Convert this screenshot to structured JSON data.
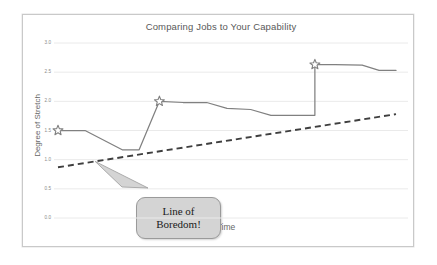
{
  "chart_data": {
    "type": "line",
    "title": "Comparing Jobs to Your Capability",
    "xlabel": "Time",
    "ylabel": "Degree of Stretch",
    "ylim": [
      0.0,
      3.0
    ],
    "xlim": [
      0,
      100
    ],
    "grid": true,
    "legend": "none",
    "y_ticks": [
      "3.0",
      "2.5",
      "2.0",
      "1.5",
      "1.0",
      "0.5",
      "0.0"
    ],
    "y_tick_values": [
      3.0,
      2.5,
      2.0,
      1.5,
      1.0,
      0.5,
      0.0
    ],
    "x_ticks": [],
    "series": [
      {
        "name": "Degree of Stretch",
        "style": "solid",
        "color": "#808080",
        "x": [
          0,
          8,
          19,
          24,
          24,
          30,
          37,
          44,
          50,
          57,
          63,
          70,
          76,
          76,
          82,
          90,
          95,
          100
        ],
        "values": [
          1.5,
          1.5,
          1.17,
          1.17,
          1.17,
          2.0,
          1.98,
          1.98,
          1.88,
          1.86,
          1.76,
          1.76,
          1.76,
          2.63,
          2.63,
          2.62,
          2.53,
          2.53
        ],
        "markers": [
          {
            "x": 0,
            "y": 1.5,
            "shape": "star"
          },
          {
            "x": 30,
            "y": 2.0,
            "shape": "star"
          },
          {
            "x": 76,
            "y": 2.63,
            "shape": "star"
          }
        ]
      },
      {
        "name": "Line of Boredom",
        "style": "dashed",
        "color": "#3f3f3f",
        "x": [
          0,
          100
        ],
        "values": [
          0.87,
          1.78
        ]
      }
    ],
    "annotations": [
      {
        "name": "line-of-boredom-callout",
        "lines": [
          "Line of",
          "Boredom!"
        ],
        "target_series": "Line of Boredom",
        "shape": "rounded-rect-callout",
        "fill": "#d4d4d4",
        "stroke": "#9a9a9a"
      }
    ]
  },
  "chart": {
    "title": "Comparing Jobs to Your Capability",
    "y_axis_label": "Degree of Stretch",
    "x_axis_label": "Time",
    "y_ticks": [
      "3.0",
      "2.5",
      "2.0",
      "1.5",
      "1.0",
      "0.5",
      "0.0"
    ],
    "callout": {
      "line1": "Line of",
      "line2": "Boredom!"
    }
  },
  "colors": {
    "series_line": "#808080",
    "boredom_line": "#3f3f3f",
    "gridline": "#eaeaea",
    "frame_border": "#c9c9c9",
    "title_text": "#595959",
    "axis_text": "#666666",
    "tick_text": "#8a8a8a",
    "callout_fill": "#d4d4d4",
    "callout_stroke": "#9a9a9a"
  }
}
